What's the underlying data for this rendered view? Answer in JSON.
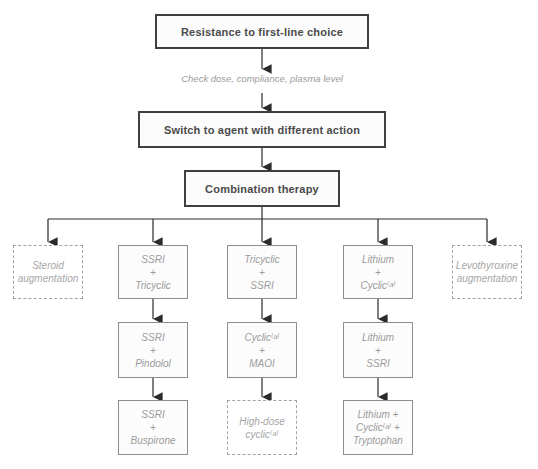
{
  "flowchart": {
    "nodes": {
      "resistance": {
        "label": "Resistance to first-line choice"
      },
      "check_note": {
        "label": "Check dose, compliance, plasma level"
      },
      "switch_agent": {
        "label": "Switch to agent with different action"
      },
      "combination": {
        "label": "Combination therapy"
      },
      "steroid_augmentation": {
        "label": "Steroid\naugmentation"
      },
      "ssri_tricyclic": {
        "label": "SSRI\n+\nTricyclic"
      },
      "tricyclic_ssri": {
        "label": "Tricyclic\n+\nSSRI"
      },
      "lithium_cyclic": {
        "label": "Lithium\n+\nCyclic⁽ᵃ⁾"
      },
      "levothyroxine_augmentation": {
        "label": "Levothyroxine\naugmentation"
      },
      "ssri_pindolol": {
        "label": "SSRI\n+\nPindolol"
      },
      "cyclic_maoi": {
        "label": "Cyclic⁽ᵃ⁾\n+\nMAOI"
      },
      "lithium_ssri": {
        "label": "Lithium\n+\nSSRI"
      },
      "ssri_buspirone": {
        "label": "SSRI\n+\nBuspirone"
      },
      "high_dose_cyclic": {
        "label": "High-dose\ncyclic⁽ᵃ⁾"
      },
      "lithium_cyclic_tryptophan": {
        "label": "Lithium +\nCyclic⁽ᵃ⁾ +\nTryptophan"
      }
    },
    "colors": {
      "primary_border": "#3f3f3f",
      "primary_text": "#4a4a4a",
      "secondary_border": "#8d8d8d",
      "secondary_text": "#9b9b9b",
      "dashed_border": "#a3a3a3",
      "arrow": "#2b2b2b",
      "background": "#ffffff"
    }
  }
}
